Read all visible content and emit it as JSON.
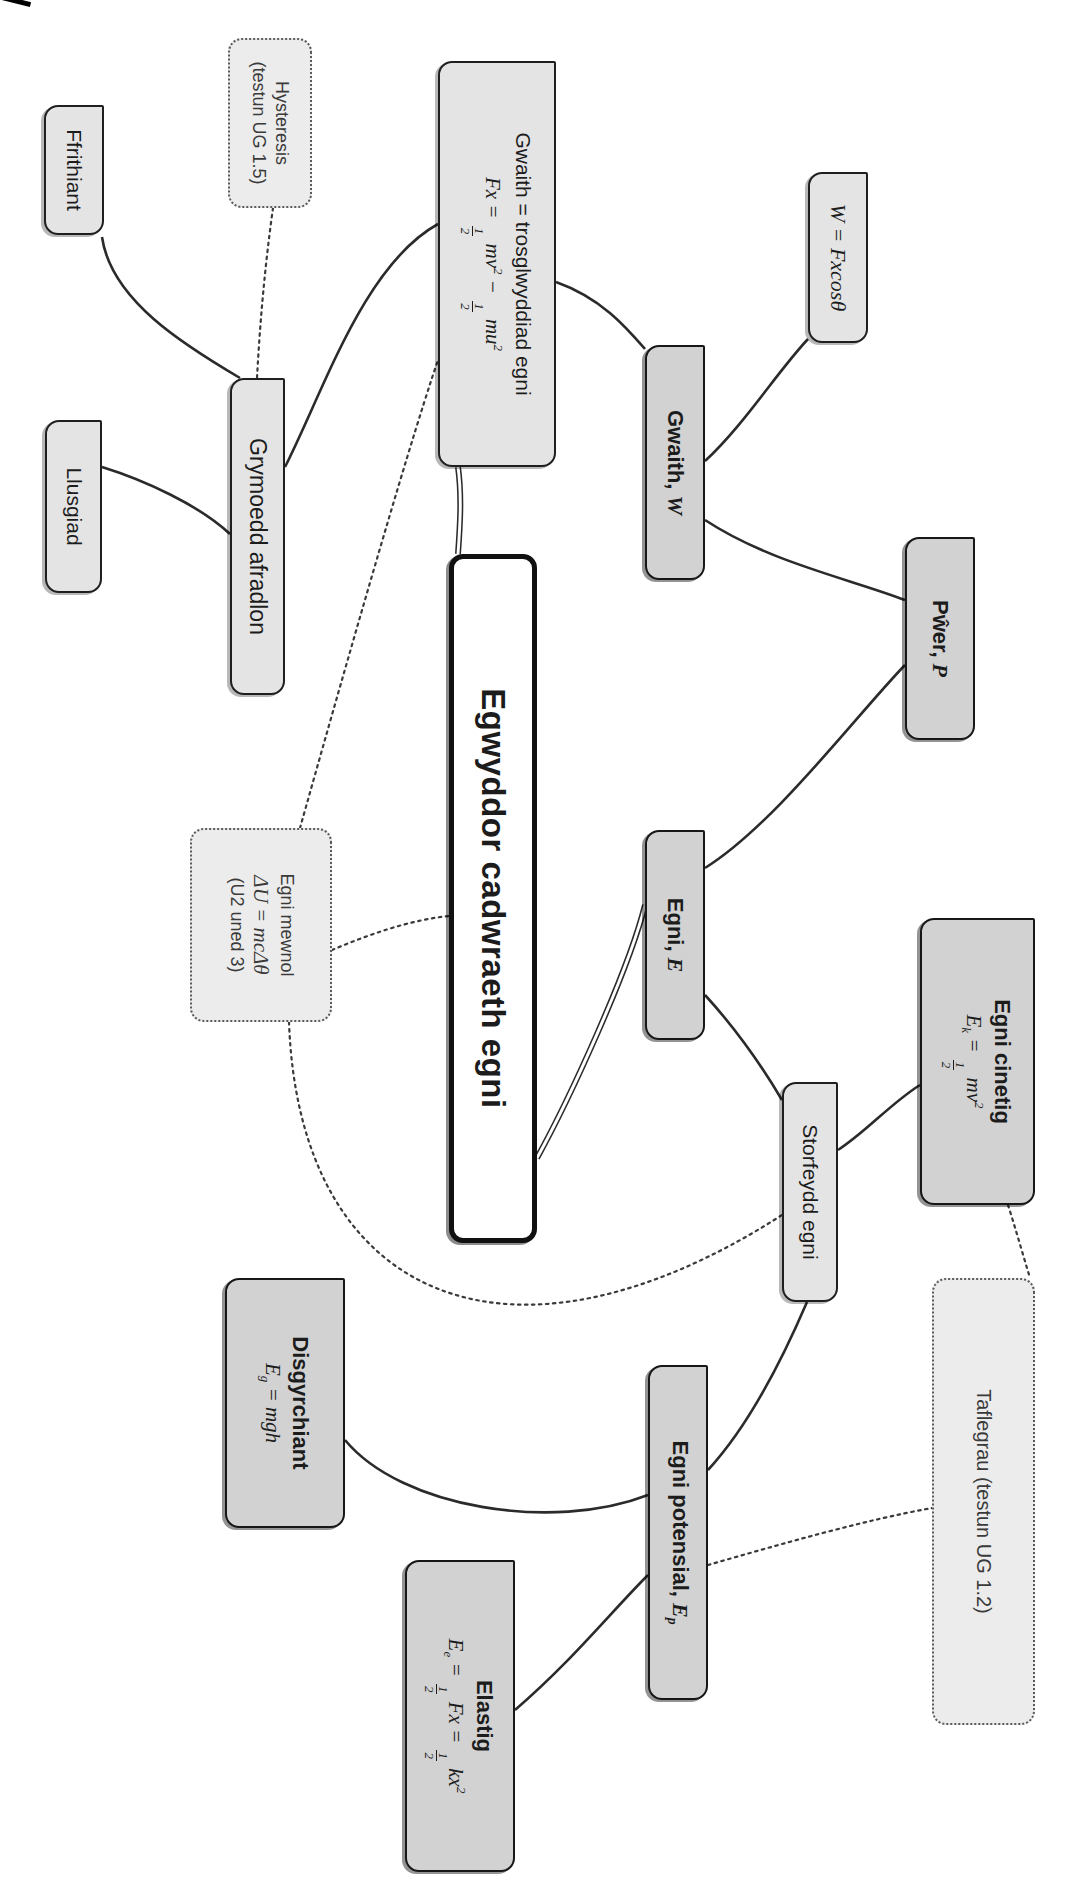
{
  "diagram": {
    "language": "Welsh",
    "topic": "Energy / conservation of energy mind map",
    "root_title": "Egwyddor cadwraeth egni"
  },
  "colors": {
    "background": "#ffffff",
    "node_light_fill": "#e4e4e4",
    "node_main_fill": "#d2d2d2",
    "node_dotted_fill": "#ececec",
    "root_fill": "#ffffff",
    "border": "#1f1f1f",
    "edge": "#2b2b2b"
  },
  "nodes": [
    {
      "id": "root",
      "style": "root",
      "x": 554,
      "y": 532,
      "w": 689,
      "h": 88,
      "lines": [
        {
          "k": "tb",
          "text": "Egwyddor cadwraeth egni"
        }
      ]
    },
    {
      "id": "gwaith_formula",
      "style": "light",
      "x": 61,
      "y": 513,
      "w": 406,
      "h": 118,
      "lines": [
        {
          "k": "t",
          "text": "Gwaith = trosglwyddiad egni"
        },
        {
          "k": "m",
          "text": "Fx = 1/2 mv^2 − 1/2 mu^2"
        }
      ]
    },
    {
      "id": "gwaith_w",
      "style": "main",
      "x": 345,
      "y": 364,
      "w": 235,
      "h": 60,
      "lines": [
        {
          "k": "tb",
          "text": "Gwaith,",
          "sym": "W"
        }
      ]
    },
    {
      "id": "w_fxcos",
      "style": "light",
      "x": 172,
      "y": 201,
      "w": 171,
      "h": 60,
      "lines": [
        {
          "k": "m",
          "text": "W = Fxcosθ"
        }
      ]
    },
    {
      "id": "pwer",
      "style": "main",
      "x": 537,
      "y": 94,
      "w": 203,
      "h": 70,
      "lines": [
        {
          "k": "tb",
          "text": "Pŵer,",
          "sym": "P"
        }
      ]
    },
    {
      "id": "egni_e",
      "style": "main",
      "x": 830,
      "y": 364,
      "w": 210,
      "h": 60,
      "lines": [
        {
          "k": "tb",
          "text": "Egni,",
          "sym": "E"
        }
      ]
    },
    {
      "id": "egni_cinetig",
      "style": "main",
      "x": 918,
      "y": 34,
      "w": 287,
      "h": 115,
      "lines": [
        {
          "k": "tb",
          "text": "Egni cinetig"
        },
        {
          "k": "m",
          "text": "E_k = 1/2 mv^2"
        }
      ]
    },
    {
      "id": "storfeydd",
      "style": "light",
      "x": 1082,
      "y": 231,
      "w": 220,
      "h": 56,
      "lines": [
        {
          "k": "t",
          "text": "Storfeydd egni"
        }
      ]
    },
    {
      "id": "egni_potensial",
      "style": "main",
      "x": 1365,
      "y": 361,
      "w": 335,
      "h": 60,
      "lines": [
        {
          "k": "tb",
          "text": "Egni potensial,",
          "sym": "E_p"
        }
      ]
    },
    {
      "id": "disgyrchiant",
      "style": "main",
      "x": 1278,
      "y": 724,
      "w": 250,
      "h": 120,
      "lines": [
        {
          "k": "tb",
          "text": "Disgyrchiant"
        },
        {
          "k": "m",
          "text": "E_g = mgh"
        }
      ]
    },
    {
      "id": "elastig",
      "style": "main",
      "x": 1560,
      "y": 554,
      "w": 312,
      "h": 110,
      "lines": [
        {
          "k": "tb",
          "text": "Elastig"
        },
        {
          "k": "m",
          "text": "E_e = 1/2 Fx = 1/2 kx^2"
        }
      ]
    },
    {
      "id": "taflegrau",
      "style": "dotted",
      "x": 1278,
      "y": 34,
      "w": 447,
      "h": 103,
      "lines": [
        {
          "k": "note",
          "text": "Taflegrau (testun UG 1.2)"
        }
      ]
    },
    {
      "id": "egni_mewnol",
      "style": "dotted",
      "x": 828,
      "y": 737,
      "w": 194,
      "h": 142,
      "lines": [
        {
          "k": "note",
          "text": "Egni mewnol"
        },
        {
          "k": "m",
          "text": "ΔU = mcΔθ"
        },
        {
          "k": "note",
          "text": "(U2 uned 3)"
        }
      ]
    },
    {
      "id": "hysteresis",
      "style": "dotted",
      "x": 38,
      "y": 757,
      "w": 170,
      "h": 84,
      "lines": [
        {
          "k": "note",
          "text": "Hysteresis"
        },
        {
          "k": "note",
          "text": "(testun UG 1.5)"
        }
      ]
    },
    {
      "id": "grymoedd",
      "style": "light",
      "x": 378,
      "y": 784,
      "w": 317,
      "h": 55,
      "lines": [
        {
          "k": "t",
          "text": "Grymoedd afradlon"
        }
      ]
    },
    {
      "id": "ffrithiant",
      "style": "light",
      "x": 105,
      "y": 965,
      "w": 130,
      "h": 60,
      "lines": [
        {
          "k": "t",
          "text": "Ffrithiant"
        }
      ]
    },
    {
      "id": "llusgiad",
      "style": "light",
      "x": 420,
      "y": 967,
      "w": 173,
      "h": 57,
      "lines": [
        {
          "k": "t",
          "text": "Llusgiad"
        }
      ]
    }
  ],
  "edges": [
    {
      "from": "ffrithiant",
      "to": "grymoedd",
      "style": "solid",
      "d": "M237,967 C300,958 345,885 378,829"
    },
    {
      "from": "llusgiad",
      "to": "grymoedd",
      "style": "solid",
      "d": "M467,967 C480,925 505,870 534,839"
    },
    {
      "from": "grymoedd",
      "to": "gwaith_formula",
      "style": "solid",
      "d": "M467,784 C390,745 265,705 224,631"
    },
    {
      "from": "gwaith_formula",
      "to": "gwaith_w",
      "style": "solid",
      "d": "M282,513 C298,468 327,443 349,424"
    },
    {
      "from": "gwaith_w",
      "to": "w_fxcos",
      "style": "solid",
      "d": "M461,364 C425,325 372,292 339,261"
    },
    {
      "from": "gwaith_w",
      "to": "pwer",
      "style": "solid",
      "d": "M520,364 C562,300 578,222 600,164"
    },
    {
      "from": "egni_e",
      "to": "pwer",
      "style": "solid",
      "d": "M868,364 C825,295 718,215 665,164"
    },
    {
      "from": "egni_e",
      "to": "storfeydd",
      "style": "solid",
      "d": "M995,364 C1030,332 1068,306 1100,287"
    },
    {
      "from": "storfeydd",
      "to": "egni_cinetig",
      "style": "solid",
      "d": "M1150,231 C1132,203 1103,178 1085,149"
    },
    {
      "from": "storfeydd",
      "to": "egni_potensial",
      "style": "solid",
      "d": "M1302,262 C1372,292 1432,326 1470,361"
    },
    {
      "from": "disgyrchiant",
      "to": "egni_potensial",
      "style": "solid",
      "d": "M1440,724 C1508,668 1532,516 1495,421"
    },
    {
      "from": "elastig",
      "to": "egni_potensial",
      "style": "solid",
      "d": "M1710,554 C1662,498 1612,458 1575,421"
    },
    {
      "from": "gwaith_formula",
      "to": "root",
      "style": "double",
      "d": "M467,611 C496,607 526,609 554,611"
    },
    {
      "from": "root",
      "to": "egni_e",
      "style": "double",
      "d": "M1158,532 C1100,500 970,440 905,424"
    },
    {
      "from": "hysteresis",
      "to": "grymoedd",
      "style": "dotted",
      "d": "M208,796 C265,804 322,809 378,812"
    },
    {
      "from": "egni_mewnol",
      "to": "gwaith_formula",
      "style": "dotted",
      "d": "M828,769 C700,733 460,665 360,631"
    },
    {
      "from": "egni_mewnol",
      "to": "root",
      "style": "dotted",
      "d": "M950,737 C934,699 920,659 916,620"
    },
    {
      "from": "egni_mewnol",
      "to": "storfeydd",
      "style": "dotted",
      "d": "M1022,780 C1300,770 1390,560 1215,287"
    },
    {
      "from": "egni_cinetig",
      "to": "taflegrau",
      "style": "dotted",
      "d": "M1205,61 C1230,53 1255,46 1278,39"
    },
    {
      "from": "egni_potensial",
      "to": "taflegrau",
      "style": "dotted",
      "d": "M1565,361 C1544,288 1520,204 1508,137"
    }
  ]
}
